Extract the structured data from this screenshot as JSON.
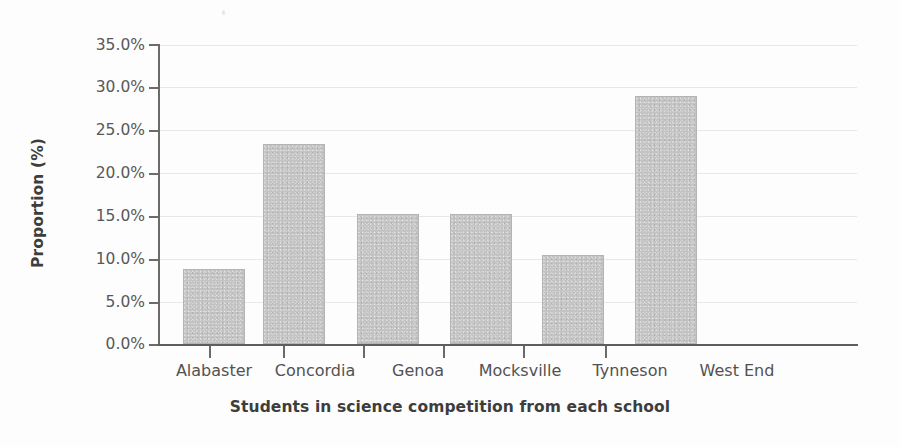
{
  "chart_data": {
    "type": "bar",
    "title": "",
    "subtitle": "",
    "xlabel": "Students in science competition from each school",
    "ylabel": "Proportion (%)",
    "categories": [
      "Alabaster",
      "Concordia",
      "Genoa",
      "Mocksville",
      "Tynneson",
      "West End"
    ],
    "values": [
      8.8,
      23.4,
      15.2,
      15.2,
      10.4,
      29.0
    ],
    "value_labels": [
      "8.8%",
      "23.4%",
      "15.2%",
      "15.2%",
      "10.4%",
      "29.0%"
    ],
    "ylim": [
      0.0,
      35.0
    ],
    "ytick_values": [
      0.0,
      5.0,
      10.0,
      15.0,
      20.0,
      25.0,
      30.0,
      35.0
    ],
    "ytick_labels": [
      "0.0%",
      "5.0%",
      "10.0%",
      "15.0%",
      "20.0%",
      "25.0%",
      "30.0%",
      "35.0%"
    ],
    "grid": true,
    "grid_axis": "y",
    "legend": false,
    "legend_position": "none",
    "bar_color": "#c3c3c3",
    "bar_edge_color": "#b4b4b4",
    "grid_color": "#e8e8e8",
    "axis_color": "#6b6b6b",
    "text_color": "#525252",
    "background_color": "#fdfdfd"
  }
}
